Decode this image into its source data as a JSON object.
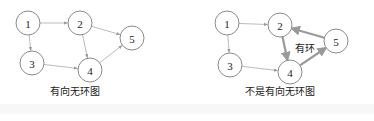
{
  "diagrams": [
    {
      "caption": "有向无环图",
      "nodes": [
        {
          "id": "1",
          "x": 28,
          "y": 23
        },
        {
          "id": "2",
          "x": 80,
          "y": 23
        },
        {
          "id": "3",
          "x": 32,
          "y": 63
        },
        {
          "id": "4",
          "x": 90,
          "y": 70
        },
        {
          "id": "5",
          "x": 132,
          "y": 38
        }
      ],
      "edges": [
        {
          "from": "1",
          "to": "2"
        },
        {
          "from": "1",
          "to": "3"
        },
        {
          "from": "2",
          "to": "4"
        },
        {
          "from": "2",
          "to": "5"
        },
        {
          "from": "3",
          "to": "4"
        },
        {
          "from": "4",
          "to": "5"
        }
      ]
    },
    {
      "caption": "不是有向无环图",
      "cycle_label": "有环",
      "nodes": [
        {
          "id": "1",
          "x": 227,
          "y": 23
        },
        {
          "id": "2",
          "x": 280,
          "y": 25
        },
        {
          "id": "3",
          "x": 230,
          "y": 65
        },
        {
          "id": "4",
          "x": 290,
          "y": 72
        },
        {
          "id": "5",
          "x": 336,
          "y": 41
        }
      ],
      "edges": [
        {
          "from": "1",
          "to": "2"
        },
        {
          "from": "1",
          "to": "3"
        },
        {
          "from": "3",
          "to": "4"
        },
        {
          "from": "2",
          "to": "4",
          "bold": true
        },
        {
          "from": "4",
          "to": "5",
          "bold": true
        },
        {
          "from": "5",
          "to": "2",
          "bold": true
        }
      ]
    }
  ]
}
